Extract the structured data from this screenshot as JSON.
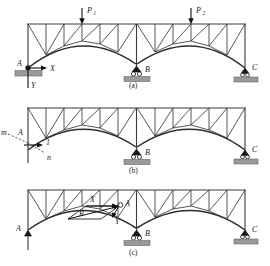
{
  "figure": {
    "panels": [
      {
        "caption": "(a)",
        "description": "Loaded two-span arched truss with pin support at A and roller supports at B and C",
        "labels": {
          "support_a": "A",
          "support_b": "B",
          "support_c": "C",
          "axis_x": "X",
          "axis_y": "Y",
          "load_1": "P",
          "load_1_sub": "1",
          "load_2": "P",
          "load_2_sub": "2"
        }
      },
      {
        "caption": "(b)",
        "description": "Section cut m-n at support A showing reaction direction 1",
        "labels": {
          "support_a": "A",
          "support_b": "B",
          "support_c": "C",
          "cut_start": "m",
          "cut_end": "n",
          "reaction_dir": "1"
        }
      },
      {
        "caption": "(c)",
        "description": "Resultant reaction R resolved into components X and Y at support A",
        "labels": {
          "support_a_left": "A",
          "support_a_point": "A",
          "support_b": "B",
          "support_c": "C",
          "resultant": "R",
          "component_x": "X",
          "component_y": "Y"
        }
      }
    ],
    "colors": {
      "line": "#3a3a3a",
      "arc": "#2e2e2e",
      "ground_hatch": "#9a9a9a",
      "background": "#ffffff",
      "text": "#1a1a1a"
    }
  }
}
